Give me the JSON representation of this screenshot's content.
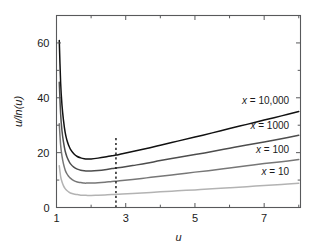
{
  "chart_data": {
    "type": "line",
    "title": "",
    "xlabel": "u",
    "ylabel": "u/ln(u)",
    "xlim": [
      1,
      8.05
    ],
    "ylim": [
      0,
      70
    ],
    "xticks": [
      1,
      3,
      5,
      7
    ],
    "xticklabels": [
      "1",
      "3",
      "5",
      "7"
    ],
    "xminorticks": [
      2,
      4,
      6,
      8
    ],
    "yticks": [
      0,
      20,
      40,
      60
    ],
    "yticklabels": [
      "0",
      "20",
      "40",
      "60"
    ],
    "yminorticks": [
      10,
      30,
      50,
      70
    ],
    "grid": false,
    "legend_position": "inline-right",
    "annotations": [
      {
        "name": "minimum-marker",
        "type": "vertical-dashed-line",
        "x": 2.718,
        "y_from": 0,
        "y_to": 25.3,
        "color": "#111111"
      }
    ],
    "series": [
      {
        "name": "x = 10,000",
        "label_prefix": "x",
        "label_equals": "=",
        "label_value": "10,000",
        "color": "#111111",
        "label_x": 7.72,
        "label_y": 37.8,
        "x": [
          1.08,
          1.12,
          1.16,
          1.2,
          1.25,
          1.3,
          1.35,
          1.4,
          1.5,
          1.6,
          1.7,
          1.8,
          1.9,
          2.0,
          2.2,
          2.4,
          2.6,
          2.718,
          2.9,
          3.2,
          3.6,
          4.0,
          4.5,
          5.0,
          5.5,
          6.0,
          6.5,
          7.0,
          7.5,
          8.0
        ],
        "y": [
          60.9,
          45.3,
          37.1,
          32.0,
          27.4,
          24.6,
          22.7,
          21.3,
          19.6,
          18.6,
          18.1,
          17.8,
          17.7,
          17.7,
          18.0,
          18.4,
          18.9,
          19.1,
          19.6,
          20.4,
          21.5,
          22.7,
          24.2,
          25.7,
          27.2,
          28.8,
          30.3,
          31.9,
          33.4,
          35.0
        ]
      },
      {
        "name": "x = 1000",
        "label_prefix": "x",
        "label_equals": "=",
        "label_value": "1000",
        "color": "#4d4d4d",
        "label_x": 7.72,
        "label_y": 28.8,
        "x": [
          1.08,
          1.12,
          1.16,
          1.2,
          1.25,
          1.3,
          1.35,
          1.4,
          1.5,
          1.6,
          1.7,
          1.8,
          1.9,
          2.0,
          2.2,
          2.4,
          2.6,
          2.718,
          2.9,
          3.2,
          3.6,
          4.0,
          4.5,
          5.0,
          5.5,
          6.0,
          6.5,
          7.0,
          7.5,
          8.0
        ],
        "y": [
          45.7,
          34.0,
          27.8,
          24.0,
          20.6,
          18.5,
          17.1,
          16.0,
          14.7,
          14.0,
          13.6,
          13.4,
          13.3,
          13.3,
          13.5,
          13.8,
          14.2,
          14.4,
          14.7,
          15.3,
          16.1,
          17.1,
          18.2,
          19.3,
          20.4,
          21.6,
          22.8,
          23.9,
          25.1,
          26.3
        ]
      },
      {
        "name": "x = 100",
        "label_prefix": "x",
        "label_equals": "=",
        "label_value": "100",
        "color": "#777777",
        "label_x": 7.72,
        "label_y": 20.0,
        "x": [
          1.08,
          1.12,
          1.16,
          1.2,
          1.25,
          1.3,
          1.35,
          1.4,
          1.5,
          1.6,
          1.7,
          1.8,
          1.9,
          2.0,
          2.2,
          2.4,
          2.6,
          2.718,
          2.9,
          3.2,
          3.6,
          4.0,
          4.5,
          5.0,
          5.5,
          6.0,
          6.5,
          7.0,
          7.5,
          8.0
        ],
        "y": [
          30.5,
          22.7,
          18.6,
          16.0,
          13.7,
          12.3,
          11.4,
          10.7,
          9.8,
          9.3,
          9.1,
          8.9,
          8.9,
          8.9,
          9.0,
          9.2,
          9.5,
          9.6,
          9.8,
          10.2,
          10.8,
          11.4,
          12.1,
          12.9,
          13.6,
          14.4,
          15.2,
          16.0,
          16.7,
          17.5
        ]
      },
      {
        "name": "x = 10",
        "label_prefix": "x",
        "label_equals": "=",
        "label_value": "10",
        "color": "#b3b3b3",
        "label_x": 7.72,
        "label_y": 11.7,
        "x": [
          1.08,
          1.12,
          1.16,
          1.2,
          1.25,
          1.3,
          1.35,
          1.4,
          1.5,
          1.6,
          1.7,
          1.8,
          1.9,
          2.0,
          2.2,
          2.4,
          2.6,
          2.718,
          2.9,
          3.2,
          3.6,
          4.0,
          4.5,
          5.0,
          5.5,
          6.0,
          6.5,
          7.0,
          7.5,
          8.0
        ],
        "y": [
          15.2,
          11.3,
          9.3,
          8.0,
          6.9,
          6.2,
          5.7,
          5.3,
          4.9,
          4.7,
          4.5,
          4.5,
          4.4,
          4.4,
          4.5,
          4.6,
          4.7,
          4.8,
          4.9,
          5.1,
          5.4,
          5.7,
          6.1,
          6.4,
          6.8,
          7.2,
          7.6,
          8.0,
          8.4,
          8.8
        ]
      }
    ]
  }
}
